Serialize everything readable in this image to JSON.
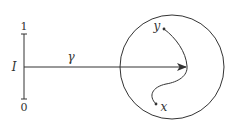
{
  "diagram": {
    "interval": {
      "name": "I",
      "top_label": "1",
      "bottom_label": "0"
    },
    "path": {
      "label": "γ"
    },
    "region": {
      "points": {
        "start": "y",
        "end": "x"
      }
    },
    "colors": {
      "stroke": "#333333",
      "background": "#ffffff"
    }
  }
}
